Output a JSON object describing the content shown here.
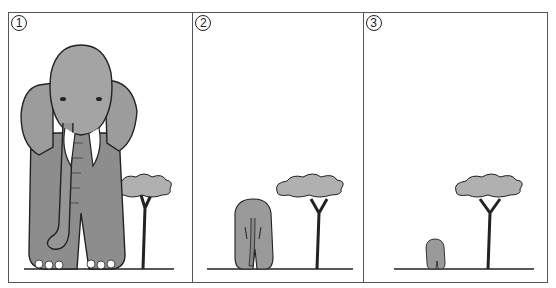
{
  "figure": {
    "panels": [
      {
        "number": "1",
        "caption": "",
        "elephant_size": "large (close)",
        "tree": "acacia"
      },
      {
        "number": "2",
        "caption": "",
        "elephant_size": "medium",
        "tree": "acacia"
      },
      {
        "number": "3",
        "caption": "",
        "elephant_size": "small (far)",
        "tree": "acacia"
      }
    ]
  },
  "colors": {
    "frame": "#555555",
    "ink": "#222222",
    "elephant_fill": "#9a9a9a",
    "tree_fill": "#a8a8a8"
  }
}
